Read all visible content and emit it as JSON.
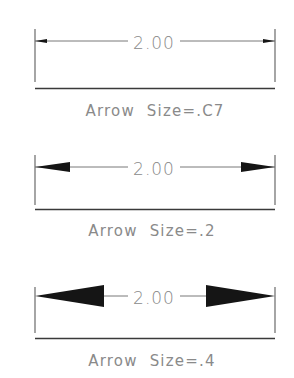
{
  "colors": {
    "line": "#6a6a6a",
    "baseline": "#3a3a3a",
    "arrow": "#151515",
    "text": "#8a8a8a"
  },
  "panels": [
    {
      "dimension_text": "2.00",
      "label": "Arrow  Size=.C7",
      "arrow_size": ".C7"
    },
    {
      "dimension_text": "2.00",
      "label": "Arrow  Size=.2",
      "arrow_size": ".2"
    },
    {
      "dimension_text": "2.00",
      "label": "Arrow  Size=.4",
      "arrow_size": ".4"
    }
  ]
}
